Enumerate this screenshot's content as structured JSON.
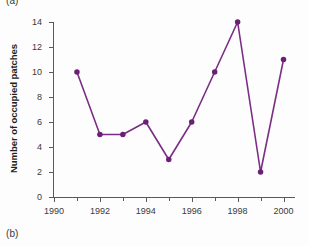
{
  "figure": {
    "panel_label_a": "(a)",
    "panel_label_b": "(b)"
  },
  "colors": {
    "line": "#7b2e84",
    "marker": "#6b2076",
    "axis": "#58595b",
    "text": "#231f20",
    "background": "#fdfdfd"
  },
  "chart_data": {
    "type": "line",
    "title": "",
    "xlabel": "",
    "ylabel": "Number of occupied patches",
    "x": [
      1991,
      1992,
      1993,
      1994,
      1995,
      1996,
      1997,
      1998,
      1999,
      2000
    ],
    "values": [
      10,
      5,
      5,
      6,
      3,
      6,
      10,
      14,
      2,
      11
    ],
    "series": [
      {
        "name": "Number of occupied patches",
        "values": [
          10,
          5,
          5,
          6,
          3,
          6,
          10,
          14,
          2,
          11
        ]
      }
    ],
    "xlim": [
      1990,
      2000.5
    ],
    "ylim": [
      0,
      14
    ],
    "y_ticks": [
      0,
      2,
      4,
      6,
      8,
      10,
      12,
      14
    ],
    "y_tick_labels": [
      "0",
      "2",
      "4",
      "6",
      "8",
      "10",
      "12",
      "14"
    ],
    "x_ticks_major": [
      1990,
      1992,
      1994,
      1996,
      1998,
      2000
    ],
    "x_tick_labels": [
      "1990",
      "1992",
      "1994",
      "1996",
      "1998",
      "2000"
    ],
    "x_ticks_minor": [
      1991,
      1993,
      1995,
      1997,
      1999
    ],
    "grid": false,
    "legend": null,
    "markers": "filled-circle",
    "marker_size": 5,
    "line_width": 1.6
  }
}
